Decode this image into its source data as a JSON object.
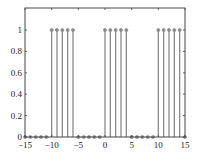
{
  "chart_data": {
    "type": "stem",
    "title": "",
    "xlabel": "",
    "ylabel": "",
    "xlim": [
      -15,
      15
    ],
    "ylim": [
      0,
      1.2
    ],
    "grid": false,
    "legend": null,
    "x_ticks": [
      -15,
      -10,
      -5,
      0,
      5,
      10,
      15
    ],
    "x_tick_labels": [
      "-15",
      "-10",
      "-5",
      "0",
      "5",
      "10",
      "15"
    ],
    "y_ticks": [
      0,
      0.2,
      0.4,
      0.6,
      0.8,
      1
    ],
    "y_tick_labels": [
      "0",
      "0.2",
      "0.4",
      "0.6",
      "0.8",
      "1"
    ],
    "x": [
      -15,
      -14,
      -13,
      -12,
      -11,
      -10,
      -9,
      -8,
      -7,
      -6,
      -5,
      -4,
      -3,
      -2,
      -1,
      0,
      1,
      2,
      3,
      4,
      5,
      6,
      7,
      8,
      9,
      10,
      11,
      12,
      13,
      14,
      15
    ],
    "values": [
      0,
      0,
      0,
      0,
      0,
      1,
      1,
      1,
      1,
      1,
      0,
      0,
      0,
      0,
      0,
      1,
      1,
      1,
      1,
      1,
      0,
      0,
      0,
      0,
      0,
      1,
      1,
      1,
      1,
      1,
      0
    ],
    "colors": {
      "stem": "#8a8a8a",
      "marker": "#8a8a8a",
      "axis": "#444444"
    }
  }
}
